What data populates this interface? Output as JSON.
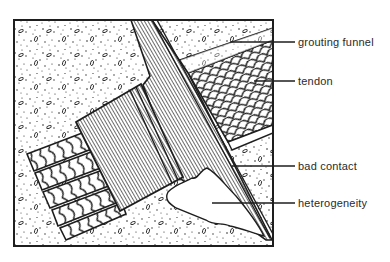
{
  "figure": {
    "labels": [
      {
        "id": "grouting-funnel",
        "text": "grouting funnel",
        "x": 298,
        "y": 37
      },
      {
        "id": "tendon",
        "text": "tendon",
        "x": 298,
        "y": 76
      },
      {
        "id": "bad-contact",
        "text": "bad contact",
        "x": 298,
        "y": 160
      },
      {
        "id": "heterogeneity",
        "text": "heterogeneity",
        "x": 298,
        "y": 196
      }
    ],
    "colors": {
      "ink": "#1e1e1e",
      "background": "#ffffff",
      "label_text": "#2a2a2a"
    }
  }
}
